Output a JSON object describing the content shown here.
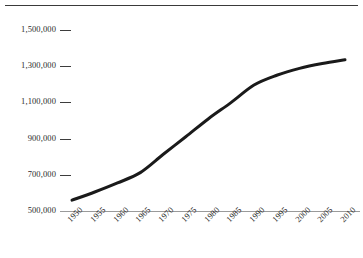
{
  "chart_data": {
    "type": "line",
    "title": "",
    "subtitle": "",
    "xlabel": "",
    "ylabel": "",
    "x": [
      1950,
      1955,
      1960,
      1965,
      1970,
      1975,
      1980,
      1985,
      1990,
      1995,
      2000,
      2005,
      2010
    ],
    "categories": [
      "1950",
      "1955",
      "1960",
      "1965",
      "1970",
      "1975",
      "1980",
      "1985",
      "1990",
      "1995",
      "2000",
      "2005",
      "2010"
    ],
    "values": [
      560000,
      605000,
      655000,
      712000,
      812000,
      910000,
      1010000,
      1100000,
      1196000,
      1250000,
      1288000,
      1315000,
      1336000
    ],
    "series": [
      {
        "name": "",
        "values": [
          560000,
          605000,
          655000,
          712000,
          812000,
          910000,
          1010000,
          1100000,
          1196000,
          1250000,
          1288000,
          1315000,
          1336000
        ]
      }
    ],
    "xlim": [
      1950,
      2010
    ],
    "ylim": [
      500000,
      1500000
    ],
    "ytick_values": [
      500000,
      700000,
      900000,
      1100000,
      1300000,
      1500000
    ],
    "ytick_labels": [
      "500,000",
      "700,000",
      "900,000",
      "1,100,000",
      "1,300,000",
      "1,500,000"
    ],
    "xtick_labels": [
      "1950",
      "1955",
      "1960",
      "1965",
      "1970",
      "1975",
      "1980",
      "1985",
      "1990",
      "1995",
      "2000",
      "2005",
      "2010"
    ],
    "grid": false,
    "legend": null,
    "legend_position": "none",
    "annotations": [],
    "line_color": "#1a1a1a",
    "line_width": 3,
    "axis_color": "#9a9a9a",
    "tick_color": "#3d3d3d",
    "text_color": "#2b2b2b",
    "background_color": "#ffffff",
    "top_rule_color": "#3a3a3a"
  },
  "axes": {
    "y_ticks": [
      {
        "label": "1,500,000"
      },
      {
        "label": "1,300,000"
      },
      {
        "label": "1,100,000"
      },
      {
        "label": "900,000"
      },
      {
        "label": "700,000"
      },
      {
        "label": "500,000"
      }
    ],
    "x_ticks": [
      {
        "label": "1950"
      },
      {
        "label": "1955"
      },
      {
        "label": "1960"
      },
      {
        "label": "1965"
      },
      {
        "label": "1970"
      },
      {
        "label": "1975"
      },
      {
        "label": "1980"
      },
      {
        "label": "1985"
      },
      {
        "label": "1990"
      },
      {
        "label": "1995"
      },
      {
        "label": "2000"
      },
      {
        "label": "2005"
      },
      {
        "label": "2010"
      }
    ]
  }
}
